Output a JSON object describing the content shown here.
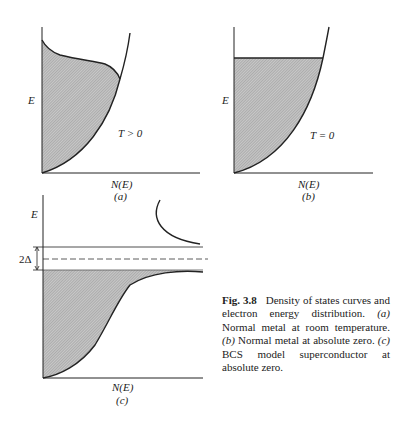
{
  "figure": {
    "number": "Fig. 3.8",
    "caption_title": "Density of states curves and electron energy distribution.",
    "caption_parts": [
      {
        "tag": "(a)",
        "text": "Normal metal at room temperature."
      },
      {
        "tag": "(b)",
        "text": "Normal metal at absolute zero."
      },
      {
        "tag": "(c)",
        "text": "BCS model superconductor at absolute zero."
      }
    ]
  },
  "panels": {
    "a": {
      "y_label": "E",
      "x_label": "N(E)",
      "sub_label": "(a)",
      "annotation": "T > 0"
    },
    "b": {
      "y_label": "E",
      "x_label": "N(E)",
      "sub_label": "(b)",
      "annotation": "T = 0"
    },
    "c": {
      "y_label": "E",
      "x_label": "N(E)",
      "sub_label": "(c)",
      "gap_label": "2Δ"
    }
  },
  "colors": {
    "ink": "#222222",
    "fill": "#bdbdbd",
    "background": "#ffffff"
  }
}
